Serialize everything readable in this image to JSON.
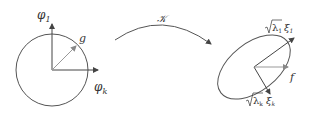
{
  "diagram": {
    "left": {
      "shape": "circle",
      "axis_vertical_label": "φ",
      "axis_vertical_sub": "1",
      "axis_horizontal_label": "φ",
      "axis_horizontal_sub": "k",
      "vector_label": "g"
    },
    "mapping": {
      "label": "𝒦"
    },
    "right": {
      "shape": "ellipse",
      "axis_major_label_sqrt": "λ",
      "axis_major_label_sqrt_sub": "1",
      "axis_major_label_xi": "ξ",
      "axis_major_label_xi_sub": "1",
      "axis_minor_label_sqrt": "λ",
      "axis_minor_label_sqrt_sub": "k",
      "axis_minor_label_xi": "ξ",
      "axis_minor_label_xi_sub": "k",
      "vector_label": "f"
    },
    "colors": {
      "stroke": "#555555",
      "vector": "#999999"
    }
  }
}
